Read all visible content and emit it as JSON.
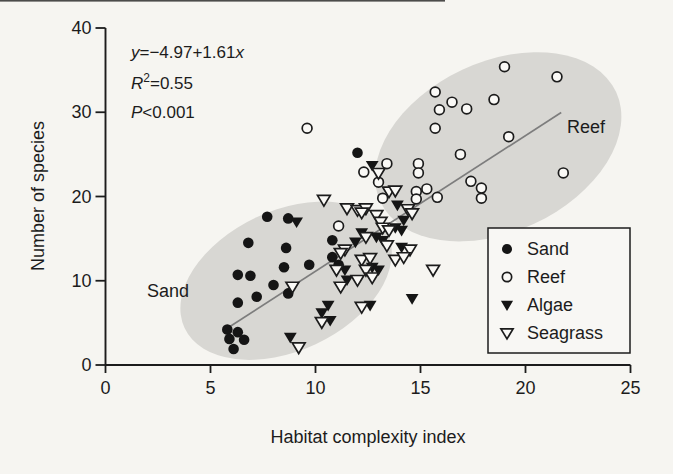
{
  "figure": {
    "annotation": {
      "equation": {
        "lhs": "y",
        "body": "=−4.97+1.61",
        "rhs": "x"
      },
      "r2": {
        "var": "R",
        "sup": "2",
        "val": "=0.55"
      },
      "p": {
        "var": "P",
        "val": "<0.001"
      }
    },
    "region_labels": {
      "sand": "Sand",
      "reef": "Reef"
    },
    "legend": {
      "items": [
        {
          "label": "Sand",
          "marker": "filled-circle"
        },
        {
          "label": "Reef",
          "marker": "open-circle"
        },
        {
          "label": "Algae",
          "marker": "filled-triangle-down"
        },
        {
          "label": "Seagrass",
          "marker": "open-triangle-down"
        }
      ]
    },
    "colors": {
      "ink": "#1c1c1c",
      "paper": "#f6f5f1",
      "marker_fill": "#151515",
      "open_fill": "#faf9f6",
      "region_fill": "#d8d7d3",
      "line": "#7d7d7d"
    }
  },
  "chart_data": {
    "type": "scatter",
    "title": "",
    "xlabel": "Habitat complexity index",
    "ylabel": "Number of species",
    "xlim": [
      0,
      25
    ],
    "ylim": [
      0,
      40
    ],
    "x_ticks": [
      0,
      5,
      10,
      15,
      20,
      25
    ],
    "y_ticks": [
      0,
      10,
      20,
      30,
      40
    ],
    "grid": false,
    "legend_position": "lower right",
    "regression": {
      "equation": "y = -4.97 + 1.61x",
      "intercept": -4.97,
      "slope": 1.61,
      "r_squared": 0.55,
      "p_value": "P < 0.001",
      "x_range": [
        5.65,
        21.7
      ]
    },
    "series": [
      {
        "name": "Sand",
        "marker": "filled-circle",
        "points": [
          [
            5.8,
            4.2
          ],
          [
            6.3,
            3.9
          ],
          [
            5.9,
            3.1
          ],
          [
            6.6,
            3.0
          ],
          [
            6.1,
            1.9
          ],
          [
            6.3,
            7.4
          ],
          [
            7.2,
            8.1
          ],
          [
            8.7,
            8.5
          ],
          [
            8.0,
            9.5
          ],
          [
            6.3,
            10.7
          ],
          [
            6.9,
            10.6
          ],
          [
            8.5,
            11.6
          ],
          [
            9.7,
            11.9
          ],
          [
            11.1,
            11.9
          ],
          [
            10.8,
            12.8
          ],
          [
            6.8,
            14.5
          ],
          [
            8.6,
            13.9
          ],
          [
            10.8,
            14.8
          ],
          [
            7.7,
            17.6
          ],
          [
            8.7,
            17.4
          ],
          [
            12.0,
            25.2
          ]
        ]
      },
      {
        "name": "Reef",
        "marker": "open-circle",
        "points": [
          [
            9.6,
            28.1
          ],
          [
            15.7,
            32.4
          ],
          [
            16.5,
            31.2
          ],
          [
            15.9,
            30.3
          ],
          [
            17.2,
            30.4
          ],
          [
            15.7,
            28.1
          ],
          [
            19.0,
            35.4
          ],
          [
            21.5,
            34.2
          ],
          [
            18.5,
            31.5
          ],
          [
            19.2,
            27.1
          ],
          [
            16.9,
            25.0
          ],
          [
            21.8,
            22.8
          ],
          [
            17.4,
            21.8
          ],
          [
            17.9,
            21.0
          ],
          [
            17.9,
            19.8
          ],
          [
            14.9,
            23.9
          ],
          [
            14.9,
            22.8
          ],
          [
            13.4,
            23.9
          ],
          [
            12.3,
            22.9
          ],
          [
            13.0,
            21.7
          ],
          [
            13.2,
            19.8
          ],
          [
            14.8,
            20.6
          ],
          [
            15.3,
            20.9
          ],
          [
            14.8,
            19.7
          ],
          [
            15.8,
            19.9
          ],
          [
            11.1,
            16.5
          ]
        ]
      },
      {
        "name": "Algae",
        "marker": "filled-triangle-down",
        "points": [
          [
            12.7,
            23.7
          ],
          [
            9.1,
            17.0
          ],
          [
            13.9,
            19.0
          ],
          [
            14.2,
            17.2
          ],
          [
            12.2,
            15.7
          ],
          [
            13.8,
            16.3
          ],
          [
            14.1,
            16.0
          ],
          [
            12.9,
            15.2
          ],
          [
            13.2,
            14.8
          ],
          [
            14.1,
            14.0
          ],
          [
            11.9,
            14.6
          ],
          [
            12.7,
            11.6
          ],
          [
            11.4,
            11.3
          ],
          [
            13.0,
            11.3
          ],
          [
            11.5,
            10.1
          ],
          [
            14.6,
            7.9
          ],
          [
            12.6,
            7.1
          ],
          [
            10.6,
            7.1
          ],
          [
            10.3,
            6.2
          ],
          [
            10.7,
            5.3
          ],
          [
            8.8,
            3.3
          ]
        ]
      },
      {
        "name": "Seagrass",
        "marker": "open-triangle-down",
        "points": [
          [
            8.9,
            9.3
          ],
          [
            10.4,
            19.6
          ],
          [
            13.0,
            22.8
          ],
          [
            13.5,
            20.6
          ],
          [
            13.8,
            20.7
          ],
          [
            11.5,
            18.6
          ],
          [
            12.0,
            18.4
          ],
          [
            12.4,
            18.6
          ],
          [
            12.2,
            18.1
          ],
          [
            14.4,
            18.5
          ],
          [
            14.6,
            18.0
          ],
          [
            12.9,
            17.8
          ],
          [
            13.1,
            17.0
          ],
          [
            13.2,
            16.3
          ],
          [
            13.5,
            16.0
          ],
          [
            12.4,
            15.2
          ],
          [
            13.4,
            14.2
          ],
          [
            14.5,
            13.7
          ],
          [
            11.4,
            13.7
          ],
          [
            11.2,
            13.3
          ],
          [
            12.2,
            12.5
          ],
          [
            12.6,
            12.7
          ],
          [
            13.8,
            12.5
          ],
          [
            14.2,
            12.8
          ],
          [
            15.6,
            11.3
          ],
          [
            11.0,
            11.3
          ],
          [
            12.4,
            11.3
          ],
          [
            12.7,
            10.4
          ],
          [
            12.0,
            10.1
          ],
          [
            11.2,
            9.3
          ],
          [
            12.2,
            6.9
          ],
          [
            10.3,
            5.1
          ],
          [
            9.2,
            2.1
          ]
        ]
      }
    ],
    "group_ellipses": [
      {
        "label": "Sand",
        "center": [
          8.6,
          10.0
        ],
        "rx_px": 112,
        "ry_px": 70,
        "angle_deg": -25,
        "label_xy": [
          1.95,
          8.1
        ]
      },
      {
        "label": "Reef",
        "center": [
          18.7,
          25.9
        ],
        "rx_px": 130,
        "ry_px": 85,
        "angle_deg": -25,
        "label_xy": [
          21.95,
          27.7
        ]
      }
    ]
  }
}
